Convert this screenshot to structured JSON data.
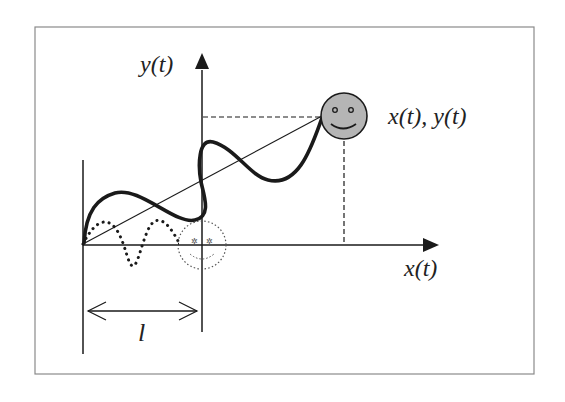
{
  "labels": {
    "y_axis": "y(t)",
    "x_axis": "x(t)",
    "position": "x(t), y(t)",
    "length": "l"
  },
  "colors": {
    "frame": "#8a8a8a",
    "line": "#1a1a1a",
    "smiley_fill": "#b5b5b5",
    "background": "#ffffff"
  },
  "elements": {
    "smiley_solid": "smiley at x(t), y(t)",
    "smiley_dotted": "ghost smiley at origin of y-axis"
  }
}
